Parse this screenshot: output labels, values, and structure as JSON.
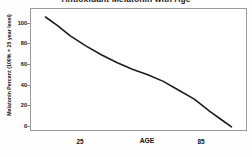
{
  "chart_data": {
    "type": "line",
    "title": "Antioxidant Melatonin with Age",
    "xlabel": "AGE",
    "ylabel": "Melatonin Percent (100% = 25 year level)",
    "xlim": [
      20,
      90
    ],
    "ylim": [
      0,
      100
    ],
    "grid": false,
    "legend": null,
    "x_tick_labels": [
      "25",
      "85"
    ],
    "x_tick_values": [
      25,
      85
    ],
    "y_tick_labels": [
      "0",
      "20",
      "40",
      "60",
      "80",
      "100"
    ],
    "y_tick_values": [
      0,
      20,
      40,
      60,
      80,
      100
    ],
    "series": [
      {
        "name": "Melatonin Percent",
        "color": "#1c1c1c",
        "x": [
          25,
          29,
          33,
          38,
          43,
          48,
          53,
          58,
          63,
          68,
          73,
          78,
          82,
          85
        ],
        "values": [
          100,
          92,
          83,
          74,
          66,
          59,
          53,
          48,
          42,
          34,
          26,
          15,
          7,
          1
        ]
      }
    ]
  }
}
